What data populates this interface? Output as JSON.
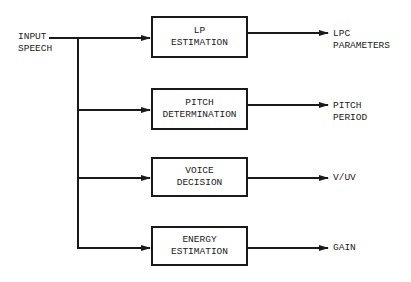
{
  "diagram": {
    "input": {
      "line1": "INPUT",
      "line2": "SPEECH"
    },
    "blocks": [
      {
        "line1": "LP",
        "line2": "ESTIMATION",
        "output": {
          "line1": "LPC",
          "line2": "PARAMETERS"
        }
      },
      {
        "line1": "PITCH",
        "line2": "DETERMINATION",
        "output": {
          "line1": "PITCH",
          "line2": "PERIOD"
        }
      },
      {
        "line1": "VOICE",
        "line2": "DECISION",
        "output": {
          "line1": "V/UV",
          "line2": ""
        }
      },
      {
        "line1": "ENERGY",
        "line2": "ESTIMATION",
        "output": {
          "line1": "GAIN",
          "line2": ""
        }
      }
    ],
    "colors": {
      "stroke": "#1a1a1a",
      "background": "#ffffff"
    }
  }
}
